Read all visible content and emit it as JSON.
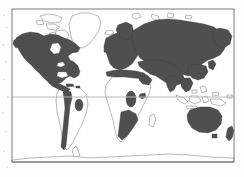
{
  "figure": {
    "type": "world-distribution-map",
    "caption": "",
    "projection": "equirectangular",
    "background_color": "#fdfdfd",
    "frame": {
      "color": "#7a7a7a",
      "line_width": 1,
      "x": 12,
      "y": 9,
      "width": 222,
      "height": 153
    },
    "graticule": {
      "visible": true,
      "color": "#b9b9b9",
      "lines": [
        {
          "name": "equator",
          "y": 97,
          "label": ""
        },
        {
          "name": "southern-latitude",
          "y": 162,
          "label": ""
        }
      ]
    },
    "legend": {
      "visible": false,
      "entries": [
        {
          "label": "distribution / range",
          "color": "#4f4f4f",
          "swatch": "filled"
        },
        {
          "label": "absent",
          "color": "#ffffff",
          "swatch": "outline"
        }
      ]
    },
    "colors": {
      "shaded_land": "#4f4f4f",
      "shaded_land_alt": "#565656",
      "unshaded_land_stroke": "#8a8a8a",
      "ocean": "#ffffff",
      "frame": "#7a7a7a",
      "graticule": "#b9b9b9"
    }
  },
  "regions": {
    "shaded": [
      {
        "name": "north-america",
        "label": "North America"
      },
      {
        "name": "central-america",
        "label": "Central America"
      },
      {
        "name": "andes-south-america",
        "label": "Andes / western South America"
      },
      {
        "name": "brazil-patch",
        "label": "Central Brazil patch"
      },
      {
        "name": "europe",
        "label": "Europe"
      },
      {
        "name": "north-africa-mediterranean",
        "label": "Mediterranean North Africa"
      },
      {
        "name": "russia-northern-asia",
        "label": "Russia / Northern Asia"
      },
      {
        "name": "middle-east-south-asia",
        "label": "Middle East / South Asia"
      },
      {
        "name": "east-asia",
        "label": "East Asia"
      },
      {
        "name": "central-africa-patch",
        "label": "Central / East Africa patch"
      },
      {
        "name": "horn-of-africa-patch",
        "label": "Horn of Africa patch"
      },
      {
        "name": "southern-africa-band",
        "label": "Southern Africa band"
      },
      {
        "name": "australia",
        "label": "Australia"
      },
      {
        "name": "new-zealand",
        "label": "New Zealand"
      }
    ],
    "unshaded": [
      {
        "name": "greenland",
        "label": "Greenland"
      },
      {
        "name": "canadian-arctic-archipelago",
        "label": "Canadian Arctic Archipelago"
      },
      {
        "name": "iceland",
        "label": "Iceland"
      },
      {
        "name": "svalbard",
        "label": "Svalbard"
      },
      {
        "name": "sahara-sahel",
        "label": "Sahara / Sahel"
      },
      {
        "name": "west-africa",
        "label": "West Africa"
      },
      {
        "name": "congo-basin",
        "label": "Congo Basin"
      },
      {
        "name": "madagascar",
        "label": "Madagascar"
      },
      {
        "name": "amazon-basin",
        "label": "Amazon Basin"
      },
      {
        "name": "southern-cone",
        "label": "Southern cone / Argentina"
      },
      {
        "name": "indonesia-archipelago",
        "label": "Indonesian archipelago"
      },
      {
        "name": "philippines",
        "label": "Philippines"
      },
      {
        "name": "new-guinea",
        "label": "New Guinea"
      },
      {
        "name": "antarctica",
        "label": "Antarctica"
      }
    ]
  }
}
